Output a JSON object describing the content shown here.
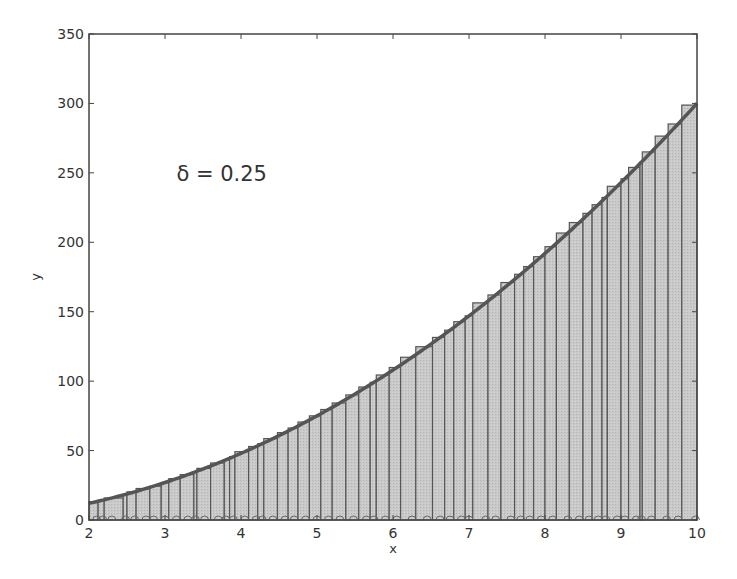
{
  "chart_data": {
    "type": "bar",
    "title": "",
    "xlabel": "x",
    "ylabel": "y",
    "xlim": [
      2,
      10
    ],
    "ylim": [
      0,
      350
    ],
    "xticks": [
      2,
      3,
      4,
      5,
      6,
      7,
      8,
      9,
      10
    ],
    "yticks": [
      0,
      50,
      100,
      150,
      200,
      250,
      300,
      350
    ],
    "grid": false,
    "legend": null,
    "annotation": {
      "text": "δ = 0.25",
      "x": 3.15,
      "y": 250
    },
    "curve": {
      "label": "y = 3x^2",
      "function": "3*x^2",
      "x_range": [
        2,
        10
      ]
    },
    "bar_style": {
      "fill": "#c8c8c8",
      "edge": "#555555"
    },
    "curve_color": "#555555",
    "partition_edges": [
      2.0,
      2.12,
      2.2,
      2.45,
      2.5,
      2.62,
      2.8,
      2.95,
      3.05,
      3.2,
      3.38,
      3.42,
      3.6,
      3.78,
      3.85,
      3.92,
      4.1,
      4.22,
      4.3,
      4.48,
      4.62,
      4.75,
      4.9,
      5.05,
      5.2,
      5.38,
      5.55,
      5.7,
      5.78,
      5.95,
      6.1,
      6.3,
      6.52,
      6.68,
      6.8,
      6.95,
      7.05,
      7.25,
      7.42,
      7.6,
      7.72,
      7.85,
      8.0,
      8.15,
      8.32,
      8.5,
      8.62,
      8.75,
      8.82,
      9.0,
      9.1,
      9.25,
      9.28,
      9.45,
      9.62,
      9.8,
      10.0
    ],
    "sample_points": [
      2.1,
      2.18,
      2.3,
      2.48,
      2.6,
      2.75,
      2.85,
      3.0,
      3.15,
      3.3,
      3.4,
      3.52,
      3.7,
      3.8,
      3.9,
      4.05,
      4.2,
      4.28,
      4.42,
      4.58,
      4.7,
      4.85,
      5.0,
      5.15,
      5.3,
      5.48,
      5.65,
      5.75,
      5.9,
      6.05,
      6.25,
      6.45,
      6.62,
      6.75,
      6.9,
      7.0,
      7.22,
      7.35,
      7.55,
      7.68,
      7.8,
      7.95,
      8.1,
      8.3,
      8.45,
      8.58,
      8.7,
      8.8,
      8.95,
      9.05,
      9.2,
      9.27,
      9.4,
      9.6,
      9.75,
      9.98
    ],
    "note": "Riemann-sum bars approximating area under y=3x^2 on [2,10]; bar heights = 3*(sample point)^2; partition estimated from pixels"
  },
  "labels": {
    "xlabel": "x",
    "ylabel": "y",
    "annotation": "δ = 0.25"
  }
}
